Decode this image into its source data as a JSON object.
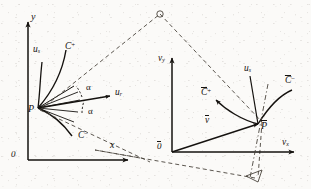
{
  "figure": {
    "type": "scientific-line-diagram",
    "ink_color": "#15120f",
    "dash_color": "#4a443c",
    "background_color": "#fbfaf8"
  },
  "left_panel": {
    "name": "physical-plane",
    "axis_y_label": "y",
    "axis_x_label": "x",
    "origin_label": "0",
    "point_label": "P",
    "curve_plus_label": "C",
    "curve_plus_sign": "+",
    "curve_minus_label": "C",
    "curve_minus_sign": "−",
    "streamline_label": "u",
    "streamline_sub": "s",
    "ray_label": "u",
    "ray_sub": "r",
    "angle_upper_label": "α",
    "angle_lower_label": "α"
  },
  "right_panel": {
    "name": "hodograph-plane",
    "axis_y_label": "v",
    "axis_y_sub": "y",
    "axis_x_label": "v",
    "axis_x_sub": "x",
    "origin_label": "0",
    "point_label": "P",
    "vector_label": "v",
    "curve_plus_label": "C",
    "curve_plus_sign": "+",
    "curve_minus_label": "C",
    "curve_minus_sign": "−",
    "streamline_label": "u",
    "streamline_sub": "s"
  },
  "connectors": {
    "apex_marker": "○",
    "corner_marker": "△"
  }
}
